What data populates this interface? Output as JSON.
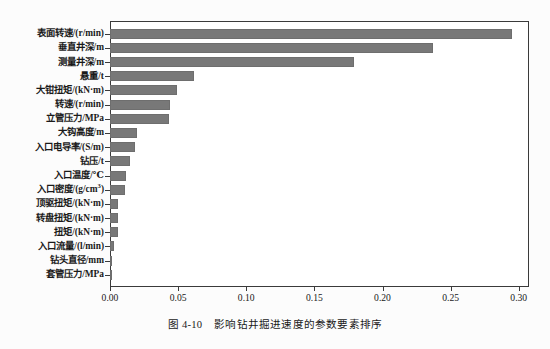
{
  "caption": {
    "number": "图 4-10",
    "text": "影响钻井掘进速度的参数要素排序"
  },
  "chart_data": {
    "type": "bar",
    "orientation": "horizontal",
    "title": "",
    "xlabel": "",
    "ylabel": "",
    "xlim": [
      0.0,
      0.3075
    ],
    "xticks": [
      0.0,
      0.05,
      0.1,
      0.15,
      0.2,
      0.25,
      0.3
    ],
    "xticklabels": [
      "0.00",
      "0.05",
      "0.10",
      "0.15",
      "0.20",
      "0.25",
      "0.30"
    ],
    "grid": false,
    "legend": false,
    "bar_color": "#787878",
    "bar_edge_color": "#6e6e6e",
    "frame_color": "#3a3a3a",
    "sorted": "descending",
    "categories": [
      "表面转速/(r/min)",
      "垂直井深/m",
      "测量井深/m",
      "悬重/t",
      "大钳扭矩/(kN·m)",
      "转速/(r/min)",
      "立管压力/MPa",
      "大钩高度/m",
      "入口电导率/(S/m)",
      "钻压/t",
      "入口温度/℃",
      "入口密度/(g/cm³)",
      "顶驱扭矩/(kN·m)",
      "转盘扭矩/(kN·m)",
      "扭矩/(kN·m)",
      "入口流量/(l/min)",
      "钻头直径/mm",
      "套管压力/MPa"
    ],
    "categories_html": [
      "表面转速/(r/min)",
      "垂直井深/m",
      "测量井深/m",
      "悬重/t",
      "大钳扭矩/(kN·m)",
      "转速/(r/min)",
      "立管压力/MPa",
      "大钩高度/m",
      "入口电导率/(S/m)",
      "钻压/t",
      "入口温度/℃",
      "入口密度/(g/cm<sup>3</sup>)",
      "顶驱扭矩/(kN·m)",
      "转盘扭矩/(kN·m)",
      "扭矩/(kN·m)",
      "入口流量/(l/min)",
      "钻头直径/mm",
      "套管压力/MPa"
    ],
    "values": [
      0.295,
      0.237,
      0.179,
      0.062,
      0.049,
      0.044,
      0.043,
      0.02,
      0.018,
      0.015,
      0.012,
      0.011,
      0.006,
      0.006,
      0.006,
      0.003,
      0.0005,
      0.0004
    ]
  }
}
